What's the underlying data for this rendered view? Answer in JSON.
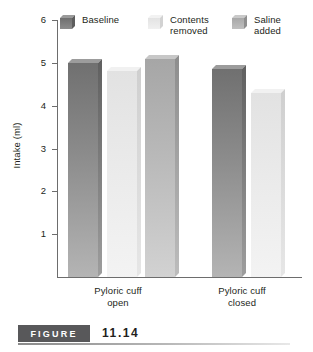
{
  "chart_data": {
    "type": "bar",
    "title": "",
    "xlabel": "",
    "ylabel": "Intake (ml)",
    "ylim": [
      0,
      6
    ],
    "yticks": [
      1,
      2,
      3,
      4,
      5,
      6
    ],
    "ytick_labels": [
      "1",
      "2",
      "3",
      "4",
      "5",
      "6"
    ],
    "grid": false,
    "legend_position": "top",
    "categories": [
      "Pyloric cuff\nopen",
      "Pyloric cuff\nclosed"
    ],
    "series": [
      {
        "name": "Baseline",
        "color": "#7b7b7b",
        "values": [
          5.0,
          4.85
        ]
      },
      {
        "name": "Contents\nremoved",
        "color": "#e9e9e9",
        "values": [
          4.8,
          4.3
        ]
      },
      {
        "name": "Saline\nadded",
        "color": "#b4b4b4",
        "values": [
          5.1,
          null
        ]
      }
    ],
    "bars": [
      {
        "group": "Pyloric cuff open",
        "series": "Baseline",
        "value": 5.0,
        "style": "dark"
      },
      {
        "group": "Pyloric cuff open",
        "series": "Contents removed",
        "value": 4.8,
        "style": "light"
      },
      {
        "group": "Pyloric cuff open",
        "series": "Saline added",
        "value": 5.1,
        "style": "mid"
      },
      {
        "group": "Pyloric cuff closed",
        "series": "Baseline",
        "value": 4.85,
        "style": "dark"
      },
      {
        "group": "Pyloric cuff closed",
        "series": "Contents removed",
        "value": 4.3,
        "style": "light"
      }
    ]
  },
  "legend": {
    "items": [
      {
        "label": "Baseline",
        "swatch": "dark"
      },
      {
        "label": "Contents\nremoved",
        "swatch": "light"
      },
      {
        "label": "Saline\nadded",
        "swatch": "mid"
      }
    ]
  },
  "axes": {
    "y_title": "Intake (ml)",
    "y_labels": [
      "6",
      "5",
      "4",
      "3",
      "2",
      "1"
    ],
    "x_labels": [
      "Pyloric cuff\nopen",
      "Pyloric cuff\nclosed"
    ]
  },
  "caption": {
    "badge": "FIGURE",
    "number": "11.14"
  }
}
